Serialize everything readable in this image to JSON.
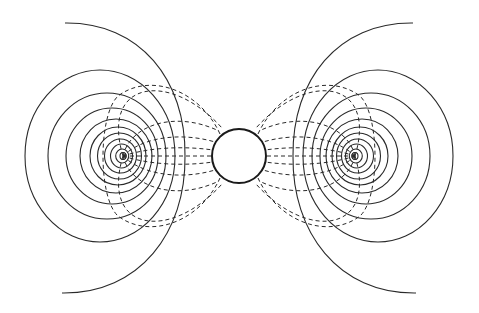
{
  "diagram": {
    "type": "electric field diagram",
    "colors": {
      "line": "#2a2a2a",
      "background": "#ffffff"
    },
    "sphere": {
      "cx": 239,
      "cy": 156,
      "r": 27
    },
    "charges": [
      {
        "name": "left-charge",
        "cx": 123,
        "cy": 156
      },
      {
        "name": "right-charge",
        "cx": 355,
        "cy": 156
      }
    ],
    "equipotential_rings_per_charge": 10,
    "field_lines_per_side": 8
  }
}
